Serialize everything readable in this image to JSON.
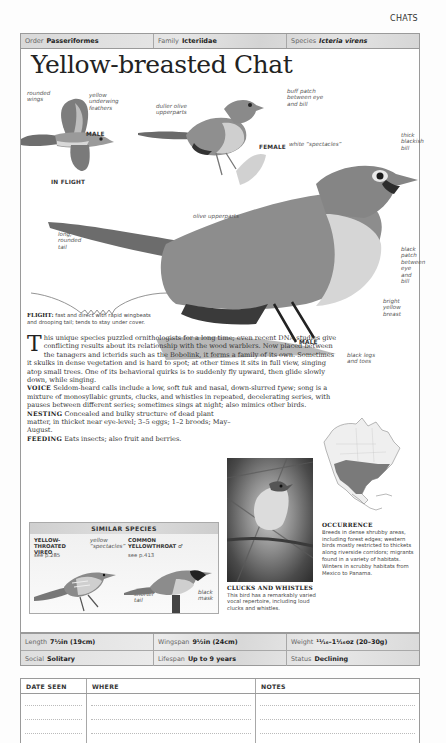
{
  "running_head": "CHATS",
  "taxonomy": {
    "order_label": "Order",
    "order_value": "Passeriformes",
    "family_label": "Family",
    "family_value": "Icteriidae",
    "species_label": "Species",
    "species_value": "Icteria virens"
  },
  "title": "Yellow-breasted Chat",
  "illustration": {
    "in_flight": {
      "labels": [
        "rounded wings",
        "yellow underwing feathers"
      ],
      "sex": "MALE",
      "caption": "IN FLIGHT"
    },
    "female": {
      "labels": [
        "duller olive upperparts",
        "buff patch between eye and bill"
      ],
      "sex": "FEMALE"
    },
    "male": {
      "labels": {
        "spectacles": "white “spectacles”",
        "bill": "thick blackish bill",
        "upperparts": "olive upperparts",
        "tail": "long, rounded tail",
        "patch": "black patch between eye and bill",
        "breast": "bright yellow breast",
        "legs": "black legs and toes"
      },
      "sex": "MALE"
    }
  },
  "flight": {
    "label": "FLIGHT:",
    "text": "fast and direct with rapid wingbeats and drooping tail; tends to stay under cover."
  },
  "description": {
    "dropcap": "T",
    "intro": "his unique species puzzled ornithologists for a long time; even recent DNA studies give conflicting results about its relationship with the wood warblers. Now placed between the tanagers and icterids such as the Bobolink, it forms a family of its own. Sometimes it skulks in dense vegetation and is hard to spot; at other times it sits in full view, singing atop small trees. One of its behavioral quirks is to suddenly fly upward, then glide slowly down, while singing.",
    "voice_label": "VOICE",
    "voice_text_1": "Seldom-heard calls include a low, soft ",
    "voice_tuk": "tuk",
    "voice_text_2": " and nasal, down-slurred ",
    "voice_tyew": "tyew",
    "voice_text_3": "; song is a mixture of monosyllabic grunts, clucks, and whistles in repeated, decelerating series, with pauses between different series; sometimes sings at night; also mimics other birds.",
    "nesting_label": "NESTING",
    "nesting_text": "Concealed and bulky structure of dead plant matter, in thicket near eye-level; 3–5 eggs; 1–2 broods; May–August.",
    "feeding_label": "FEEDING",
    "feeding_text": "Eats insects; also fruit and berries."
  },
  "similar_species": {
    "header": "SIMILAR SPECIES",
    "species": [
      {
        "name": "YELLOW-THROATED VIREO",
        "ref": "see p.285",
        "labels": [
          "yellow “spectacles”"
        ]
      },
      {
        "name": "COMMON YELLOWTHROAT ♂",
        "ref": "see p.413",
        "labels": [
          "shorter tail",
          "black mask"
        ]
      }
    ]
  },
  "photo": {
    "title": "CLUCKS AND WHISTLES",
    "caption": "This bird has a remarkably varied vocal repertoire, including loud clucks and whistles."
  },
  "occurrence": {
    "title": "OCCURRENCE",
    "text": "Breeds in dense shrubby areas, including forest edges; western birds mostly restricted to thickets along riverside corridors; migrants found in a variety of habitats. Winters in scrubby habitats from Mexico to Panama."
  },
  "stats": {
    "length_label": "Length",
    "length_value": "7½in (19cm)",
    "wingspan_label": "Wingspan",
    "wingspan_value": "9½in (24cm)",
    "weight_label": "Weight",
    "weight_value": "¹¹⁄₁₆–1¹⁄₁₆oz (20–30g)",
    "social_label": "Social",
    "social_value": "Solitary",
    "lifespan_label": "Lifespan",
    "lifespan_value": "Up to 9 years",
    "status_label": "Status",
    "status_value": "Declining"
  },
  "log": {
    "columns": [
      "DATE SEEN",
      "WHERE",
      "NOTES"
    ]
  }
}
